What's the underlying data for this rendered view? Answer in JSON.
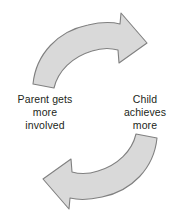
{
  "diagram": {
    "type": "cycle-diagram",
    "background_color": "#ffffff",
    "arrow_fill_color": "#d9d9d9",
    "arrow_stroke_color": "#808080",
    "text_color": "#231f20",
    "arrows": [
      {
        "name": "top-arrow",
        "direction": "clockwise",
        "points_to": "right",
        "description": "Curved arrow sweeping from lower-left up and over to the right, tip pointing down-right"
      },
      {
        "name": "bottom-arrow",
        "direction": "clockwise",
        "points_to": "left",
        "description": "Curved arrow sweeping from right down and around to the left, tip pointing down-left"
      }
    ],
    "labels": {
      "left": {
        "name": "parent-label",
        "lines": [
          "Parent gets",
          "more",
          "involved"
        ]
      },
      "right": {
        "name": "child-label",
        "lines": [
          "Child",
          "achieves",
          "more"
        ]
      }
    }
  }
}
